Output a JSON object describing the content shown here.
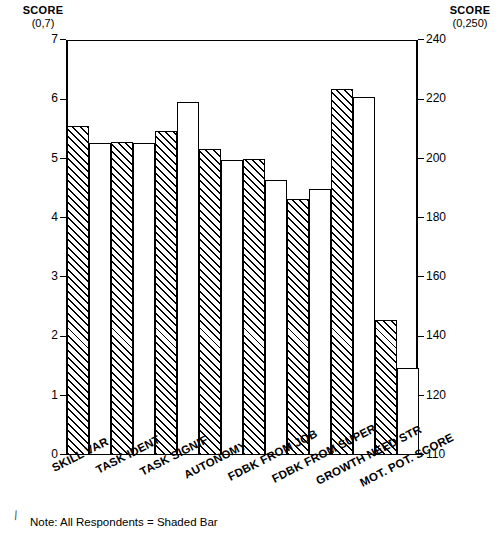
{
  "left_axis": {
    "title": "SCORE",
    "range_label": "(0,7)"
  },
  "right_axis": {
    "title": "SCORE",
    "range_label": "(0,250)"
  },
  "note": "Note:  All Respondents = Shaded Bar",
  "chart_data": {
    "type": "bar",
    "title": "",
    "xlabel": "",
    "ylabel": "SCORE (0,7)",
    "y2label": "SCORE (0,250)",
    "ylim": [
      0,
      7
    ],
    "y2lim": [
      110,
      240
    ],
    "grid": false,
    "legend": "Note:  All Respondents = Shaded Bar",
    "categories": [
      "SKILL VAR",
      "TASK IDENT",
      "TASK SIGNIF",
      "AUTONOMY",
      "FDBK FROM JOB",
      "FDBK FROM SUPER",
      "GROWTH NEED STR",
      "MOT. POT. SCORE"
    ],
    "series": [
      {
        "name": "All Respondents (Shaded Bar)",
        "style": "shaded",
        "values": [
          5.55,
          5.28,
          5.46,
          5.16,
          4.99,
          4.32,
          6.18,
          2.28
        ]
      },
      {
        "name": "Comparison (Open Bar)",
        "style": "open",
        "values": [
          5.26,
          5.26,
          5.95,
          4.97,
          4.64,
          4.49,
          6.04,
          1.47
        ]
      }
    ],
    "right_axis_values": {
      "note": "Last category MOT. POT. SCORE is read on the right axis",
      "categories": [
        "MOT. POT. SCORE"
      ],
      "shaded": [
        146.5
      ],
      "open": [
        130.0
      ]
    },
    "yticks_left": [
      0,
      1,
      2,
      3,
      4,
      5,
      6,
      7
    ],
    "yticks_right": [
      110,
      120,
      140,
      160,
      180,
      200,
      220,
      240
    ]
  }
}
